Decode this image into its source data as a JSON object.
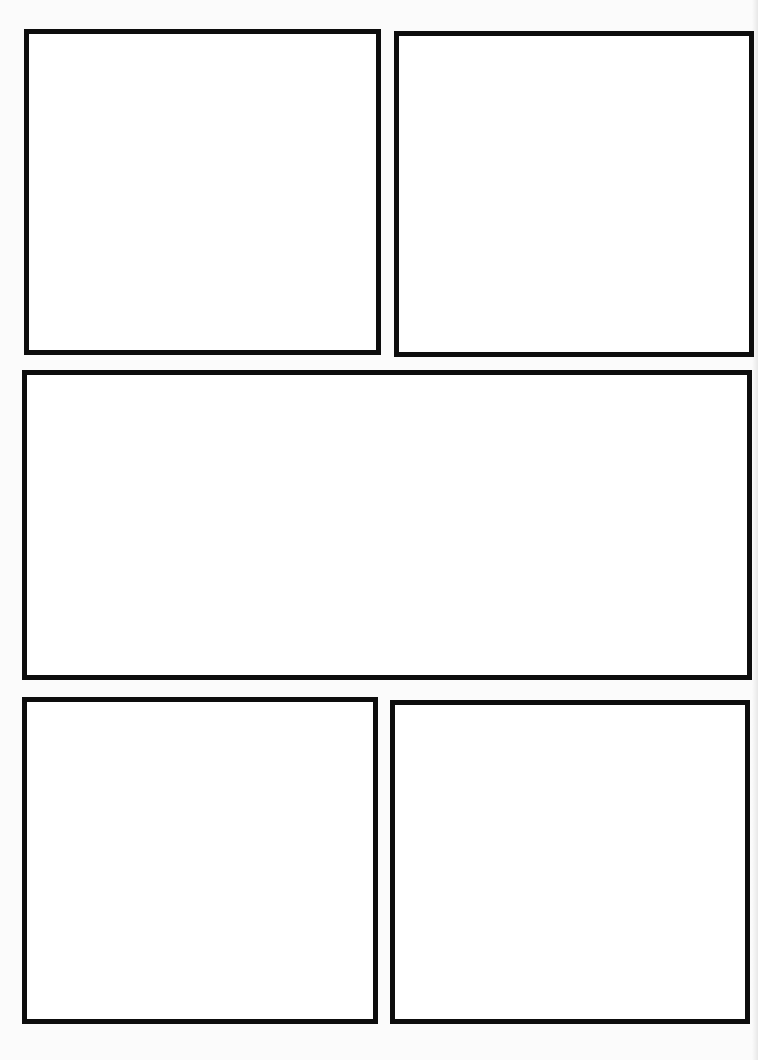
{
  "page": {
    "type": "blank comic page template",
    "background_color": "#fbfbfb",
    "border_color": "#0d0d0d",
    "border_width_px": 5,
    "panel_fill": "#ffffff"
  },
  "panels": [
    {
      "id": "panel-1",
      "row": 1,
      "position": "top-left",
      "x": 24,
      "y": 29,
      "w": 357,
      "h": 326,
      "content": ""
    },
    {
      "id": "panel-2",
      "row": 1,
      "position": "top-right",
      "x": 394,
      "y": 31,
      "w": 360,
      "h": 326,
      "content": ""
    },
    {
      "id": "panel-3",
      "row": 2,
      "position": "middle-wide",
      "x": 22,
      "y": 370,
      "w": 730,
      "h": 310,
      "content": ""
    },
    {
      "id": "panel-4",
      "row": 3,
      "position": "bottom-left",
      "x": 22,
      "y": 697,
      "w": 356,
      "h": 327,
      "content": ""
    },
    {
      "id": "panel-5",
      "row": 3,
      "position": "bottom-right",
      "x": 390,
      "y": 700,
      "w": 360,
      "h": 324,
      "content": ""
    }
  ]
}
